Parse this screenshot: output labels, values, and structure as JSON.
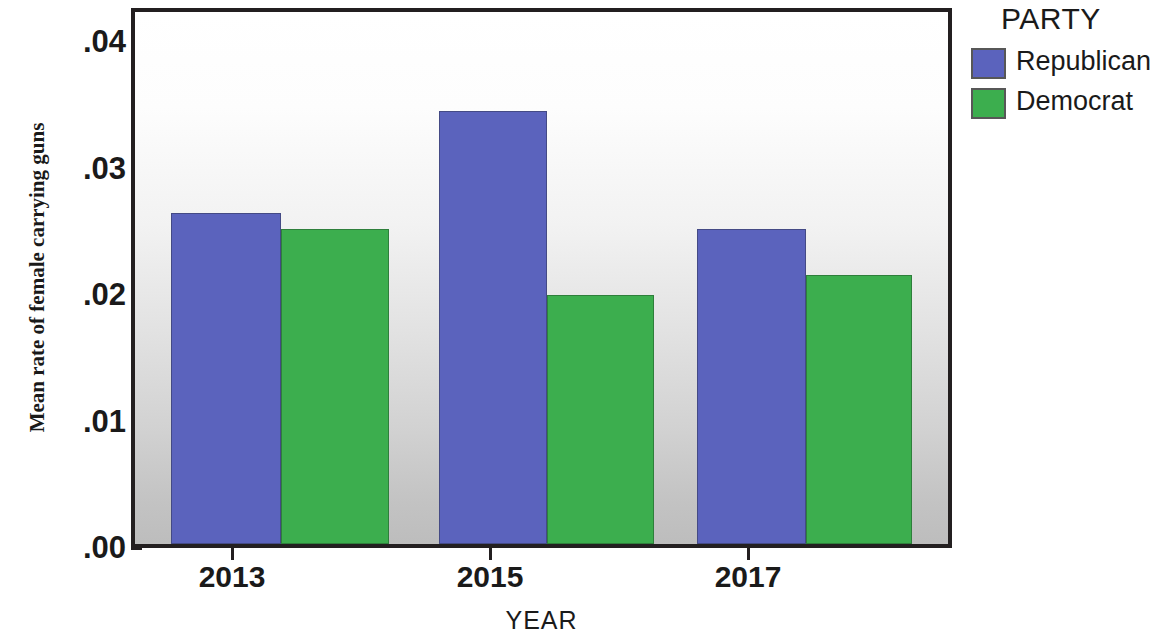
{
  "chart_data": {
    "type": "bar",
    "title": "",
    "xlabel": "YEAR",
    "ylabel": "Mean rate of female carrying guns",
    "categories": [
      "2013",
      "2015",
      "2017"
    ],
    "series": [
      {
        "name": "Republican",
        "color": "#5b63bd",
        "values": [
          0.0262,
          0.0342,
          0.0249
        ]
      },
      {
        "name": "Democrat",
        "color": "#3cae4e",
        "values": [
          0.0249,
          0.0197,
          0.0213
        ]
      }
    ],
    "ylim": [
      0.0,
      0.042
    ],
    "ytick_values": [
      0.0,
      0.01,
      0.02,
      0.03,
      0.04
    ],
    "ytick_labels": [
      ".00",
      ".01",
      ".02",
      ".03",
      ".04"
    ],
    "grid": false,
    "legend_position": "right-top",
    "legend_title": "PARTY"
  },
  "axes": {
    "y_title": "Mean rate of female carrying guns",
    "x_title": "YEAR",
    "y_ticks": [
      {
        "label": ".04",
        "value": 0.04
      },
      {
        "label": ".03",
        "value": 0.03
      },
      {
        "label": ".02",
        "value": 0.02
      },
      {
        "label": ".01",
        "value": 0.01
      },
      {
        "label": ".00",
        "value": 0.0
      }
    ],
    "x_ticks": [
      {
        "label": "2013"
      },
      {
        "label": "2015"
      },
      {
        "label": "2017"
      }
    ]
  },
  "legend": {
    "title": "PARTY",
    "items": [
      {
        "label": "Republican",
        "color": "#5b63bd"
      },
      {
        "label": "Democrat",
        "color": "#3cae4e"
      }
    ]
  }
}
